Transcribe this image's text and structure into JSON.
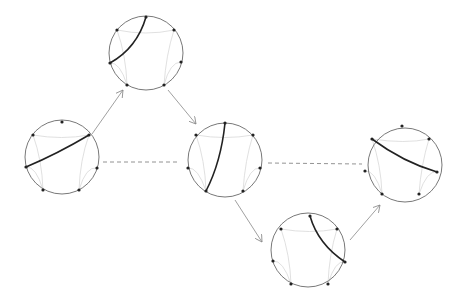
{
  "diagram": {
    "nodes": [
      {
        "id": "top",
        "cx": 146,
        "cy": 53,
        "r": 37
      },
      {
        "id": "left",
        "cx": 62,
        "cy": 157,
        "r": 37
      },
      {
        "id": "middle",
        "cx": 225,
        "cy": 160,
        "r": 37
      },
      {
        "id": "right",
        "cx": 405,
        "cy": 165,
        "r": 37
      },
      {
        "id": "bottom",
        "cx": 308,
        "cy": 250,
        "r": 37
      }
    ],
    "edges": [
      {
        "from": "left",
        "to": "top",
        "style": "arrow"
      },
      {
        "from": "top",
        "to": "middle",
        "style": "arrow"
      },
      {
        "from": "middle",
        "to": "bottom",
        "style": "arrow"
      },
      {
        "from": "bottom",
        "to": "right",
        "style": "arrow"
      },
      {
        "from": "left",
        "to": "middle",
        "style": "dashed"
      },
      {
        "from": "middle",
        "to": "right",
        "style": "dashed"
      }
    ],
    "colors": {
      "circle": "#555555",
      "chord": "#222222",
      "faint": "#d8d8d8",
      "arrow": "#888888"
    }
  }
}
